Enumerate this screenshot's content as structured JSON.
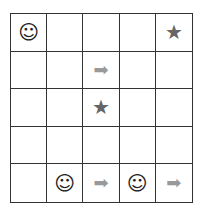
{
  "board": {
    "rows": 5,
    "cols": 5,
    "cells": [
      [
        "smiley",
        "",
        "",
        "",
        "star"
      ],
      [
        "",
        "",
        "arrow",
        "",
        ""
      ],
      [
        "",
        "",
        "star",
        "",
        ""
      ],
      [
        "",
        "",
        "",
        "",
        ""
      ],
      [
        "",
        "smiley",
        "arrow",
        "smiley",
        "arrow"
      ]
    ],
    "glyphs": {
      "smiley": "☺",
      "star": "★",
      "arrow": "➡"
    }
  }
}
